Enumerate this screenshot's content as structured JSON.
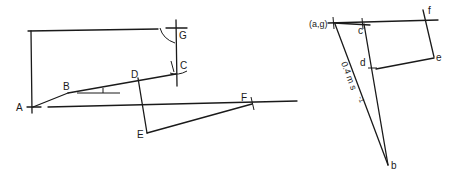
{
  "figure": {
    "type": "mechanism-and-velocity-diagram",
    "background": "#ffffff",
    "line_color": "#1a1a1a"
  },
  "space_diagram": {
    "points": {
      "A": "A",
      "B": "B",
      "C": "C",
      "D": "D",
      "E": "E",
      "F": "F",
      "G": "G"
    }
  },
  "velocity_diagram": {
    "points": {
      "ag": "(a,g)",
      "b": "b",
      "c": "c",
      "d": "d",
      "e": "e",
      "f": "f"
    },
    "scale_label": "0.4 m s",
    "scale_exponent": "-1"
  }
}
